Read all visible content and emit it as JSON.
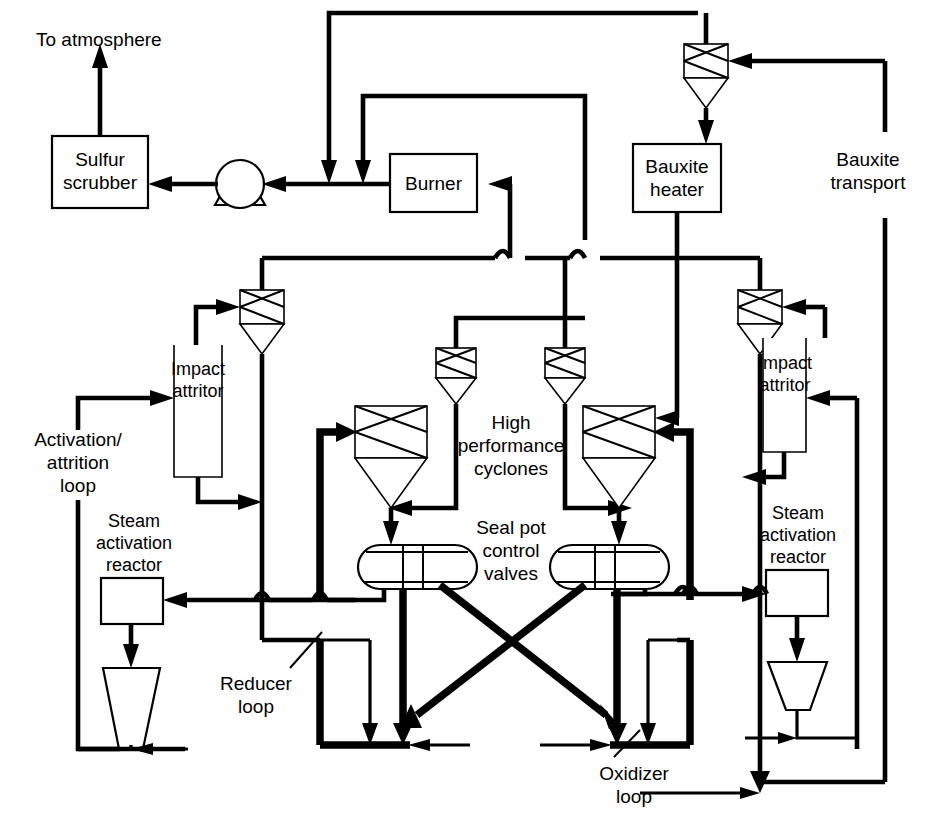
{
  "diagram": {
    "background_color": "#ffffff",
    "line_color": "#000000",
    "canvas": {
      "width": 943,
      "height": 828
    }
  },
  "labels": {
    "to_atmosphere": "To atmosphere",
    "sulfur_scrubber": "Sulfur\nscrubber",
    "burner": "Burner",
    "bauxite_heater": "Bauxite\nheater",
    "bauxite_transport": "Bauxite\ntransport",
    "impact_attritor_left": "Impact\nattritor",
    "impact_attritor_right": "Impact\nattritor",
    "activation_attrition_loop": "Activation/\nattrition\nloop",
    "steam_activation_reactor_left": "Steam\nactivation\nreactor",
    "steam_activation_reactor_right": "Steam\nactivation\nreactor",
    "high_performance_cyclones": "High\nperformance\ncyclones",
    "seal_pot_control_valves": "Seal pot\ncontrol\nvalves",
    "reducer_loop": "Reducer\nloop",
    "oxidizer_loop": "Oxidizer\nloop"
  },
  "equipment": [
    {
      "id": "sulfur-scrubber",
      "type": "box",
      "label": "Sulfur scrubber"
    },
    {
      "id": "blower",
      "type": "fan-blower",
      "label": ""
    },
    {
      "id": "burner",
      "type": "box",
      "label": "Burner"
    },
    {
      "id": "bauxite-heater",
      "type": "box",
      "label": "Bauxite heater"
    },
    {
      "id": "cyclone-top-right",
      "type": "cyclone",
      "label": ""
    },
    {
      "id": "cyclone-left-upper",
      "type": "cyclone",
      "label": ""
    },
    {
      "id": "cyclone-right-upper",
      "type": "cyclone",
      "label": ""
    },
    {
      "id": "cyclone-center-left",
      "type": "cyclone",
      "label": ""
    },
    {
      "id": "cyclone-center-right",
      "type": "cyclone",
      "label": ""
    },
    {
      "id": "cyclone-reducer",
      "type": "cyclone",
      "label": ""
    },
    {
      "id": "cyclone-oxidizer",
      "type": "cyclone",
      "label": ""
    },
    {
      "id": "impact-attritor-left",
      "type": "open-vessel",
      "label": "Impact attritor"
    },
    {
      "id": "impact-attritor-right",
      "type": "open-vessel",
      "label": "Impact attritor"
    },
    {
      "id": "steam-activation-reactor-left",
      "type": "box",
      "label": "Steam activation reactor"
    },
    {
      "id": "steam-activation-reactor-right",
      "type": "box",
      "label": "Steam activation reactor"
    },
    {
      "id": "hopper-left",
      "type": "trapezoid-hopper",
      "label": ""
    },
    {
      "id": "hopper-right",
      "type": "trapezoid-hopper",
      "label": ""
    },
    {
      "id": "seal-pot-left",
      "type": "seal-pot-valve",
      "label": ""
    },
    {
      "id": "seal-pot-right",
      "type": "seal-pot-valve",
      "label": ""
    }
  ],
  "loops": [
    {
      "id": "reducer-loop",
      "label": "Reducer loop",
      "emphasis": "thick"
    },
    {
      "id": "oxidizer-loop",
      "label": "Oxidizer loop",
      "emphasis": "thick"
    },
    {
      "id": "activation-attrition-loop",
      "label": "Activation/ attrition loop",
      "emphasis": "medium"
    },
    {
      "id": "bauxite-transport-loop",
      "label": "Bauxite transport",
      "emphasis": "medium"
    }
  ]
}
